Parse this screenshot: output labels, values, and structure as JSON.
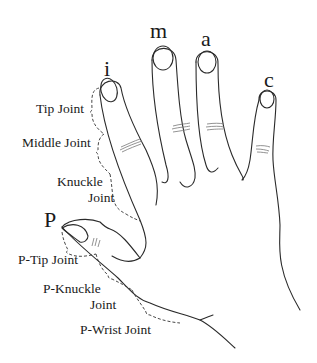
{
  "diagram": {
    "type": "hand-anatomy",
    "colors": {
      "outline": "#2a2a2a",
      "text": "#1a1a1a",
      "background": "#ffffff",
      "crease": "#777777"
    },
    "finger_labels": {
      "thumb": "P",
      "index": "i",
      "middle": "m",
      "ring": "a",
      "little": "c"
    },
    "index_joint_labels": {
      "tip": "Tip Joint",
      "middle": "Middle Joint",
      "knuckle_line1": "Knuckle",
      "knuckle_line2": "Joint"
    },
    "thumb_joint_labels": {
      "tip": "P-Tip Joint",
      "knuckle_line1": "P-Knuckle",
      "knuckle_line2": "Joint",
      "wrist": "P-Wrist Joint"
    }
  }
}
